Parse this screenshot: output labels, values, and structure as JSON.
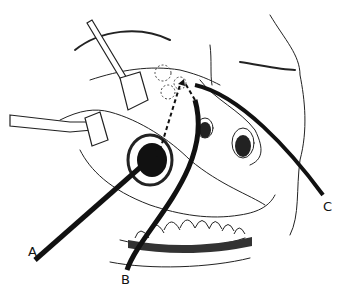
{
  "figure": {
    "labels": [
      {
        "id": "A",
        "text": "A"
      },
      {
        "id": "B",
        "text": "B"
      },
      {
        "id": "C",
        "text": "C"
      }
    ],
    "colors": {
      "ink": "#111111",
      "background": "#ffffff",
      "hatch": "#555555"
    }
  }
}
